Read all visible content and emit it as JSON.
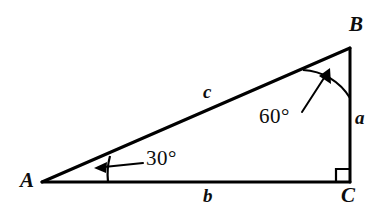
{
  "figure": {
    "type": "right-triangle-diagram",
    "background_color": "#ffffff",
    "stroke_color": "#000000",
    "vertices": {
      "A": {
        "label": "A",
        "x": 42,
        "y": 182
      },
      "B": {
        "label": "B",
        "x": 350,
        "y": 48
      },
      "C": {
        "label": "C",
        "x": 350,
        "y": 182
      }
    },
    "sides": {
      "a": {
        "label": "a",
        "between": "B-C",
        "description": "vertical leg opposite A"
      },
      "b": {
        "label": "b",
        "between": "A-C",
        "description": "horizontal leg opposite B"
      },
      "c": {
        "label": "c",
        "between": "A-B",
        "description": "hypotenuse opposite C"
      }
    },
    "angles": {
      "at_A": {
        "label": "30°",
        "value": 30,
        "vertex": "A"
      },
      "at_B": {
        "label": "60°",
        "value": 60,
        "vertex": "B"
      },
      "at_C": {
        "label": "",
        "value": 90,
        "vertex": "C",
        "marker": "right-angle-square"
      }
    }
  }
}
